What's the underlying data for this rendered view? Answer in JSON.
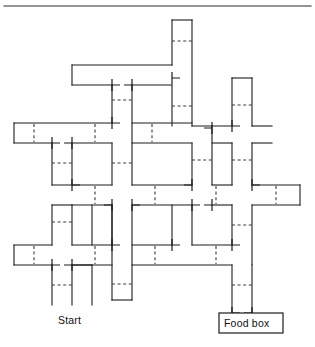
{
  "figure": {
    "type": "rodent-maze-schematic",
    "background_color": "#ffffff",
    "line_color": "#1c1c1c",
    "gate_color": "#3a3a3a",
    "width": 315,
    "height": 347
  },
  "labels": {
    "start": "Start",
    "food_box": "Food box"
  },
  "label_positions": {
    "start": {
      "x": 58,
      "y": 324
    },
    "food_box": {
      "x": 224,
      "y": 326
    }
  },
  "food_box_rect": {
    "x": 219,
    "y": 313,
    "width": 64,
    "height": 20
  },
  "top_rule": {
    "x1": 4,
    "y1": 6,
    "x2": 311,
    "y2": 6
  },
  "corridor_width": 20,
  "grid": {
    "columns": [
      14,
      34,
      72,
      92,
      112,
      132,
      172,
      192,
      232,
      252,
      280,
      300
    ],
    "rows": [
      20,
      40,
      65,
      85,
      123,
      143,
      185,
      205,
      245,
      265,
      300,
      313
    ]
  },
  "walls": [
    "M172,20 L172,126",
    "M192,20 L192,128",
    "M172,20 L192,20",
    "M72,65 L172,65",
    "M72,65 L72,85",
    "M72,85 L112,85",
    "M132,85 L172,85",
    "M112,85 L112,185",
    "M132,85 L132,185",
    "M14,123 L132,123",
    "M14,123 L14,143",
    "M14,143 L72,143",
    "M92,143 L192,143",
    "M192,126 L232,126",
    "M212,128 L300,128",
    "M72,143 L72,300",
    "M92,143 L92,185",
    "M212,128 L212,185",
    "M232,65 L232,126",
    "M232,143 L232,185",
    "M252,65 L252,185",
    "M34,185 L300,185",
    "M34,205 L112,205",
    "M132,205 L232,205",
    "M252,205 L300,205",
    "M300,185 L300,205",
    "M14,245 L232,245",
    "M14,245 L14,265",
    "M14,265 L72,265",
    "M92,265 L252,265",
    "M92,205 L92,245",
    "M112,205 L112,300",
    "M132,205 L132,300",
    "M172,205 L172,245",
    "M192,205 L192,245",
    "M34,245 L34,300",
    "M52,265 L52,300",
    "M112,300 L132,300",
    "M232,245 L232,313",
    "M252,265 L252,313",
    "M252,185 L252,205",
    "M172,143 L172,185",
    "M192,143 L192,185",
    "M212,205 L212,245",
    "M232,205 L232,245"
  ],
  "gates": [
    "M172,40 L192,40",
    "M172,105 L192,105",
    "M112,75 L132,75",
    "M112,115 L132,115",
    "M34,133 L34,133",
    "M34,123 L34,143",
    "M92,123 L92,143",
    "M232,143 L252,143",
    "M232,105 L252,105",
    "M252,135 L272,135",
    "M212,160 L232,160",
    "M112,165 L132,165",
    "M280,185 L280,205",
    "M34,245 L34,265",
    "M92,245 L92,265",
    "M212,245 L212,265",
    "M52,285 L72,285",
    "M112,285 L132,285",
    "M232,285 L252,285",
    "M92,185 L92,205",
    "M152,185 L152,205",
    "M152,245 L152,265",
    "M152,123 L152,143",
    "M192,205 L212,205"
  ],
  "doors": [
    {
      "x": 112,
      "y": 85,
      "orient": "v"
    },
    {
      "x": 132,
      "y": 85,
      "orient": "v"
    },
    {
      "x": 172,
      "y": 85,
      "orient": "v"
    },
    {
      "x": 112,
      "y": 123,
      "orient": "v"
    },
    {
      "x": 252,
      "y": 123,
      "orient": "v"
    },
    {
      "x": 212,
      "y": 123,
      "orient": "v"
    },
    {
      "x": 52,
      "y": 143,
      "orient": "v"
    },
    {
      "x": 72,
      "y": 185,
      "orient": "v"
    },
    {
      "x": 172,
      "y": 185,
      "orient": "v"
    },
    {
      "x": 252,
      "y": 185,
      "orient": "v"
    },
    {
      "x": 132,
      "y": 205,
      "orient": "v"
    },
    {
      "x": 112,
      "y": 245,
      "orient": "v"
    },
    {
      "x": 172,
      "y": 245,
      "orient": "v"
    },
    {
      "x": 232,
      "y": 245,
      "orient": "v"
    },
    {
      "x": 52,
      "y": 265,
      "orient": "v"
    },
    {
      "x": 232,
      "y": 313,
      "orient": "v"
    }
  ]
}
